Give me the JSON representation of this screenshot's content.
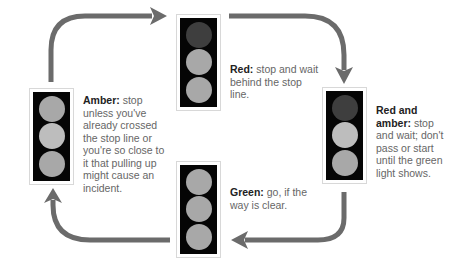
{
  "colors": {
    "arrow": "#6b6b6b",
    "housing": "#050505",
    "lamp_lit": "#a8a8a8",
    "lamp_lit_bright": "#bdbdbd",
    "lamp_dark": "#3e3e3e",
    "box_border": "#d8d8d8",
    "text_bold": "#222222",
    "text_body": "#666666"
  },
  "lights": [
    {
      "id": "red",
      "position": "top",
      "lamps": [
        "dark",
        "lit",
        "lit"
      ],
      "caption_title": "Red:",
      "caption_body": " stop and wait behind the stop line."
    },
    {
      "id": "red-and-amber",
      "position": "right",
      "lamps": [
        "dark",
        "lit_bright",
        "lit"
      ],
      "caption_title": "Red and amber:",
      "caption_body": " stop and wait; don't pass or start until the green light shows."
    },
    {
      "id": "green",
      "position": "bottom",
      "lamps": [
        "lit",
        "lit",
        "lit"
      ],
      "caption_title": "Green:",
      "caption_body": " go, if the way is clear."
    },
    {
      "id": "amber",
      "position": "left",
      "lamps": [
        "lit",
        "lit_bright",
        "lit"
      ],
      "caption_title": "Amber:",
      "caption_body": " stop unless you've already crossed the stop line or you're so close to it that pulling up might cause an incident."
    }
  ],
  "arrows": [
    {
      "from": "amber",
      "to": "red",
      "direction": "clockwise"
    },
    {
      "from": "red",
      "to": "red-and-amber",
      "direction": "clockwise"
    },
    {
      "from": "red-and-amber",
      "to": "green",
      "direction": "clockwise"
    },
    {
      "from": "green",
      "to": "amber",
      "direction": "clockwise"
    }
  ]
}
